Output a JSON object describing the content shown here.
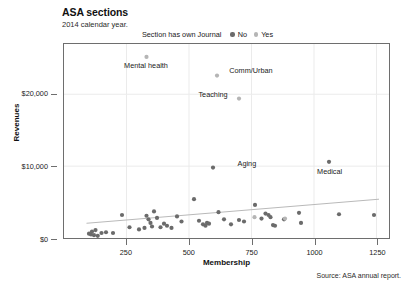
{
  "header": {
    "title": "ASA sections",
    "subtitle": "2014 calendar year."
  },
  "legend": {
    "title": "Section has own Journal",
    "entries": [
      {
        "label": "No",
        "color": "#6b6b6b"
      },
      {
        "label": "Yes",
        "color": "#b5b5b5"
      }
    ]
  },
  "source": "Source: ASA annual report.",
  "chart_data": {
    "type": "scatter",
    "title": "ASA sections",
    "subtitle": "2014 calendar year.",
    "xlabel": "Membership",
    "ylabel": "Revenues",
    "xlim": [
      0,
      1300
    ],
    "ylim": [
      0,
      27000
    ],
    "xticks": [
      250,
      500,
      750,
      1000,
      1250
    ],
    "xticklabels": [
      "250",
      "500",
      "750",
      "1000",
      "1250"
    ],
    "yticks": [
      0,
      10000,
      20000
    ],
    "yticklabels": [
      "$0",
      "$10,000",
      "$20,000"
    ],
    "grid": "light vertical and horizontal gridlines at ticks",
    "legend_position": "top-center above plot",
    "legend_title": "Section has own Journal",
    "series": [
      {
        "name": "No",
        "color": "#6b6b6b",
        "points": [
          {
            "x": 100,
            "y": 600
          },
          {
            "x": 108,
            "y": 500
          },
          {
            "x": 112,
            "y": 900
          },
          {
            "x": 120,
            "y": 400
          },
          {
            "x": 126,
            "y": 1100
          },
          {
            "x": 135,
            "y": 300
          },
          {
            "x": 150,
            "y": 700
          },
          {
            "x": 168,
            "y": 800
          },
          {
            "x": 196,
            "y": 700
          },
          {
            "x": 232,
            "y": 3200
          },
          {
            "x": 262,
            "y": 1500
          },
          {
            "x": 300,
            "y": 1200
          },
          {
            "x": 322,
            "y": 1400
          },
          {
            "x": 330,
            "y": 3100
          },
          {
            "x": 338,
            "y": 2600
          },
          {
            "x": 346,
            "y": 2100
          },
          {
            "x": 352,
            "y": 1600
          },
          {
            "x": 360,
            "y": 3700
          },
          {
            "x": 372,
            "y": 2800
          },
          {
            "x": 386,
            "y": 1500
          },
          {
            "x": 400,
            "y": 2000
          },
          {
            "x": 412,
            "y": 1700
          },
          {
            "x": 430,
            "y": 1400
          },
          {
            "x": 452,
            "y": 3000
          },
          {
            "x": 470,
            "y": 2300
          },
          {
            "x": 520,
            "y": 5400
          },
          {
            "x": 540,
            "y": 2400
          },
          {
            "x": 556,
            "y": 1900
          },
          {
            "x": 566,
            "y": 1700
          },
          {
            "x": 572,
            "y": 2100
          },
          {
            "x": 580,
            "y": 2000
          },
          {
            "x": 596,
            "y": 9800
          },
          {
            "x": 618,
            "y": 3600
          },
          {
            "x": 640,
            "y": 2600
          },
          {
            "x": 668,
            "y": 1900
          },
          {
            "x": 700,
            "y": 2500
          },
          {
            "x": 720,
            "y": 2300
          },
          {
            "x": 764,
            "y": 4600
          },
          {
            "x": 790,
            "y": 2700
          },
          {
            "x": 806,
            "y": 3400
          },
          {
            "x": 818,
            "y": 3200
          },
          {
            "x": 826,
            "y": 2900
          },
          {
            "x": 836,
            "y": 1800
          },
          {
            "x": 844,
            "y": 1700
          },
          {
            "x": 880,
            "y": 2600
          },
          {
            "x": 940,
            "y": 3500
          },
          {
            "x": 948,
            "y": 2100
          },
          {
            "x": 1060,
            "y": 10600
          },
          {
            "x": 1100,
            "y": 3300
          },
          {
            "x": 1240,
            "y": 3200
          }
        ]
      },
      {
        "name": "Yes",
        "color": "#b5b5b5",
        "points": [
          {
            "x": 330,
            "y": 25200
          },
          {
            "x": 612,
            "y": 22600
          },
          {
            "x": 700,
            "y": 19400
          },
          {
            "x": 762,
            "y": 2900
          },
          {
            "x": 884,
            "y": 2700
          }
        ]
      }
    ],
    "trendline": {
      "description": "light gray linear fit rising left to right",
      "color": "#b8b8b8",
      "x": [
        90,
        1260
      ],
      "y": [
        2050,
        5400
      ]
    },
    "annotations": [
      {
        "label": "Mental health",
        "x": 330,
        "y": 25200,
        "position": "below"
      },
      {
        "label": "Comm/Urban",
        "x": 612,
        "y": 22600,
        "position": "right"
      },
      {
        "label": "Teaching",
        "x": 700,
        "y": 19400,
        "position": "left"
      },
      {
        "label": "Aging",
        "x": 596,
        "y": 9800,
        "position": "right"
      },
      {
        "label": "Medical",
        "x": 1060,
        "y": 10600,
        "position": "below"
      }
    ]
  }
}
